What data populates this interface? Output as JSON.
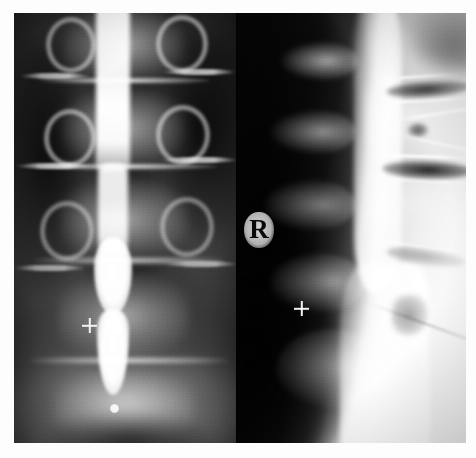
{
  "image": {
    "modality": "radiograph",
    "study": "lumbar myelogram",
    "panel_count": 2,
    "background_color": "#fdfdfd",
    "film_color": "#0a0a0a",
    "width": 476,
    "height": 458
  },
  "panels": [
    {
      "id": "ap-view",
      "name": "anteroposterior-view",
      "position": "left",
      "description": "AP lumbar spine with vertical contrast column",
      "dominant_tone": "#232323"
    },
    {
      "id": "lateral-view",
      "name": "lateral-view",
      "position": "right",
      "description": "Lateral lumbar spine, anterior soft tissue overexposed",
      "dominant_tone": "#e9e9e9"
    }
  ],
  "markers": {
    "laterality": {
      "label": "R",
      "name": "laterality-marker-right",
      "panel": "lateral-view"
    },
    "skin_markers": [
      {
        "name": "cross-marker-ap",
        "panel": "ap-view"
      },
      {
        "name": "cross-marker-lateral",
        "panel": "lateral-view"
      }
    ],
    "contrast_droplet": {
      "name": "contrast-droplet",
      "panel": "ap-view"
    }
  },
  "colors": {
    "film_black": "#0a0a0a",
    "contrast_white": "#ffffff",
    "bone_gray": "#cdcdcd",
    "page_white": "#fdfdfd"
  }
}
